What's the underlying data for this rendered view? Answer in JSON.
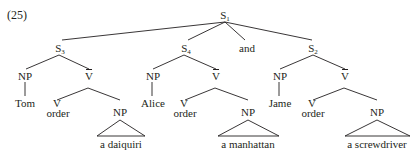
{
  "example_number": "(25)",
  "tree": {
    "root": {
      "label": "S",
      "sub": "1"
    },
    "conj": "and",
    "clauses": [
      {
        "label": "S",
        "sub": "3",
        "np": "NP",
        "subject": "Tom",
        "vbar": "V",
        "v": "V",
        "verb": "order",
        "obj_np": "NP",
        "object": "a daiquiri"
      },
      {
        "label": "S",
        "sub": "4",
        "np": "NP",
        "subject": "Alice",
        "vbar": "V",
        "v": "V",
        "verb": "order",
        "obj_np": "NP",
        "object": "a manhattan"
      },
      {
        "label": "S",
        "sub": "2",
        "np": "NP",
        "subject": "Jame",
        "vbar": "V",
        "v": "V",
        "verb": "order",
        "obj_np": "NP",
        "object": "a screwdriver"
      }
    ]
  },
  "colors": {
    "ink": "#231f20",
    "background": "#ffffff"
  }
}
